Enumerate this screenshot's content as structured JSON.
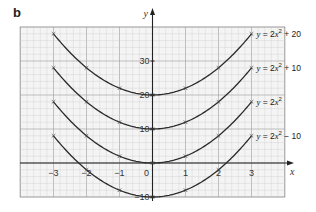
{
  "panel_label": "b",
  "chart_data": {
    "type": "line",
    "title": "",
    "xlabel": "x",
    "ylabel": "y",
    "xlim": [
      -3.9,
      4.0
    ],
    "ylim": [
      -10,
      40
    ],
    "grid": true,
    "x_ticks": [
      -3,
      -2,
      -1,
      0,
      1,
      2,
      3
    ],
    "y_ticks": [
      -10,
      10,
      20,
      30
    ],
    "x": [
      -3,
      -2,
      -1,
      0,
      1,
      2,
      3
    ],
    "series": [
      {
        "name": "y = 2x² + 20",
        "label_parts": [
          "y",
          " = 2",
          "x",
          "2",
          " + 20"
        ],
        "values": [
          38,
          28,
          22,
          20,
          22,
          28,
          38
        ]
      },
      {
        "name": "y = 2x² + 10",
        "label_parts": [
          "y",
          " = 2",
          "x",
          "2",
          " + 10"
        ],
        "values": [
          28,
          18,
          12,
          10,
          12,
          18,
          28
        ]
      },
      {
        "name": "y = 2x²",
        "label_parts": [
          "y",
          " = 2",
          "x",
          "2",
          ""
        ],
        "values": [
          18,
          8,
          2,
          0,
          2,
          8,
          18
        ]
      },
      {
        "name": "y = 2x² − 10",
        "label_parts": [
          "y",
          " = 2",
          "x",
          "2",
          " − 10"
        ],
        "values": [
          8,
          -2,
          -8,
          -10,
          -8,
          -2,
          8
        ]
      }
    ],
    "legend_position": "right, inline labels at curve ends",
    "colors": {
      "curve": "#2b2b2b",
      "grid_minor": "#c9c9c9",
      "grid_major": "#9a9a9a",
      "axis": "#222222"
    }
  }
}
